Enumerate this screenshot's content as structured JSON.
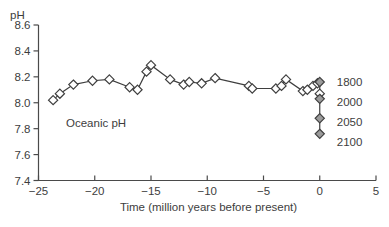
{
  "chart_data": {
    "type": "line",
    "title": "",
    "ylabel": "pH",
    "xlabel": "Time (million years before present)",
    "annotation": "Oceanic pH",
    "xlim": [
      -25,
      5
    ],
    "ylim": [
      7.4,
      8.6
    ],
    "grid": false,
    "legend": "none",
    "x_tick_values": [
      -25,
      -20,
      -15,
      -10,
      -5,
      0,
      5
    ],
    "x_tick_labels": [
      "−25",
      "−20",
      "−15",
      "−10",
      "−5",
      "0",
      "5"
    ],
    "y_tick_values": [
      7.4,
      7.6,
      7.8,
      8.0,
      8.2,
      8.4,
      8.6
    ],
    "y_tick_labels": [
      "7.4",
      "7.6",
      "7.8",
      "8.0",
      "8.2",
      "8.4",
      "8.6"
    ],
    "series": [
      {
        "name": "oceanic-ph-paleo-record",
        "marker": "open-diamond",
        "x": [
          -23.7,
          -23.1,
          -21.9,
          -20.2,
          -18.7,
          -16.9,
          -16.2,
          -15.4,
          -15.0,
          -13.3,
          -12.1,
          -11.6,
          -10.5,
          -9.3,
          -6.3,
          -6.0,
          -3.9,
          -3.4,
          -3.0,
          -1.5,
          -1.1,
          -0.6,
          -0.2
        ],
        "y": [
          8.02,
          8.07,
          8.14,
          8.17,
          8.18,
          8.12,
          8.1,
          8.24,
          8.29,
          8.18,
          8.14,
          8.16,
          8.15,
          8.19,
          8.13,
          8.11,
          8.11,
          8.13,
          8.18,
          8.09,
          8.1,
          8.13,
          8.15
        ]
      },
      {
        "name": "future-projection-at-present",
        "marker": "filled-diamond",
        "x0": 0,
        "points": [
          {
            "year": "1800",
            "ph": 8.16,
            "style": "filled"
          },
          {
            "year": "",
            "ph": 8.07,
            "style": "open"
          },
          {
            "year": "2000",
            "ph": 8.03,
            "style": "filled"
          },
          {
            "year": "2050",
            "ph": 7.88,
            "style": "filled"
          },
          {
            "year": "2100",
            "ph": 7.76,
            "style": "filled"
          }
        ]
      }
    ],
    "colors": {
      "line": "#3f3f3f",
      "axis": "#4a4a4a",
      "text": "#3d3d3d",
      "marker_open_fill": "#ffffff",
      "marker_filled_fill": "#9b9b9b",
      "background": "#ffffff"
    }
  }
}
